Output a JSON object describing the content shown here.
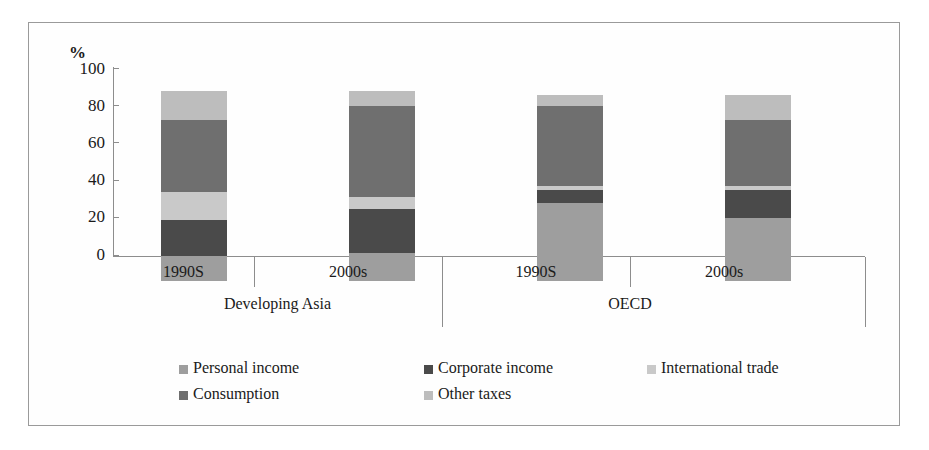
{
  "chart_data": {
    "type": "bar",
    "subtype": "stacked-100-percent",
    "title": "",
    "xlabel": "",
    "ylabel": "%",
    "ylim": [
      0,
      100
    ],
    "yticks": [
      0,
      20,
      40,
      60,
      80,
      100
    ],
    "ytick_labels": [
      "0",
      "20",
      "40",
      "60",
      "80",
      "100"
    ],
    "grid": false,
    "legend_position": "bottom",
    "groups": [
      {
        "name": "Developing Asia",
        "categories": [
          "1990S",
          "2000s"
        ]
      },
      {
        "name": "OECD",
        "categories": [
          "1990S",
          "2000s"
        ]
      }
    ],
    "categories": [
      "1990S",
      "2000s",
      "1990S",
      "2000s"
    ],
    "group_labels": [
      "Developing Asia",
      "OECD"
    ],
    "series": [
      {
        "name": "Personal income",
        "color": "#9e9e9e",
        "values": [
          13,
          15,
          41,
          33
        ]
      },
      {
        "name": "Corporate income",
        "color": "#4a4a4a",
        "values": [
          19,
          23,
          7,
          15
        ]
      },
      {
        "name": "International trade",
        "color": "#c9c9c9",
        "values": [
          15,
          6,
          2,
          2
        ]
      },
      {
        "name": "Consumption",
        "color": "#6f6f6f",
        "values": [
          38,
          48,
          42,
          35
        ]
      },
      {
        "name": "Other taxes",
        "color": "#bdbdbd",
        "values": [
          15,
          8,
          6,
          13
        ]
      }
    ],
    "bar_totals": [
      100,
      100,
      98,
      98
    ],
    "annotations": []
  },
  "axis": {
    "unit_symbol": "%",
    "ticks": [
      "100",
      "80",
      "60",
      "40",
      "20",
      "0"
    ]
  },
  "legend": {
    "entries": [
      {
        "label": "Personal income",
        "swatch_color": "#9e9e9e"
      },
      {
        "label": "Corporate income",
        "swatch_color": "#4a4a4a"
      },
      {
        "label": "International trade",
        "swatch_color": "#c9c9c9"
      },
      {
        "label": "Consumption",
        "swatch_color": "#6f6f6f"
      },
      {
        "label": "Other taxes",
        "swatch_color": "#bdbdbd"
      }
    ]
  },
  "category_labels": [
    "1990S",
    "2000s",
    "1990S",
    "2000s"
  ],
  "group_labels": [
    "Developing Asia",
    "OECD"
  ]
}
